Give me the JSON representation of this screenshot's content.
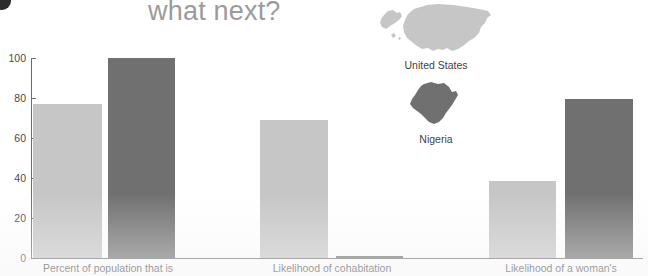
{
  "page": {
    "title_text": "what next?",
    "corner_marker": "bullet-dot"
  },
  "legend": {
    "position": "top-center-right",
    "items": [
      {
        "label": "United States",
        "color": "#c6c6c6",
        "icon": "usa-map-icon"
      },
      {
        "label": "Nigeria",
        "color": "#707070",
        "icon": "nigeria-map-icon"
      }
    ]
  },
  "chart_data": {
    "type": "bar",
    "title": "what next?",
    "xlabel": "",
    "ylabel": "",
    "ylim": [
      0,
      100
    ],
    "yticks": [
      0,
      20,
      40,
      60,
      80,
      100
    ],
    "ytick_labels": [
      "0",
      "20",
      "40",
      "60",
      "80",
      "100"
    ],
    "grid": false,
    "legend_position": "top-center",
    "categories": [
      "Percent of population that is",
      "Likelihood of cohabitation",
      "Likelihood of a woman's"
    ],
    "series": [
      {
        "name": "United States",
        "color": "#c6c6c6",
        "values": [
          77,
          69,
          38.5
        ]
      },
      {
        "name": "Nigeria",
        "color": "#707070",
        "values": [
          100,
          1,
          79.5
        ]
      }
    ]
  }
}
